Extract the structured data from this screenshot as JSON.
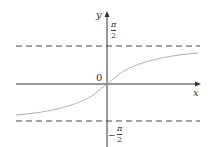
{
  "diagram": {
    "x_axis_label": "x",
    "y_axis_label": "y",
    "origin_label": "0",
    "upper_asymptote": {
      "num": "π",
      "den": "2",
      "sign": ""
    },
    "lower_asymptote": {
      "num": "π",
      "den": "2",
      "sign": "−"
    },
    "colors": {
      "axis": "#333333",
      "curve": "#b0b0b0",
      "dash": "#444444"
    }
  }
}
